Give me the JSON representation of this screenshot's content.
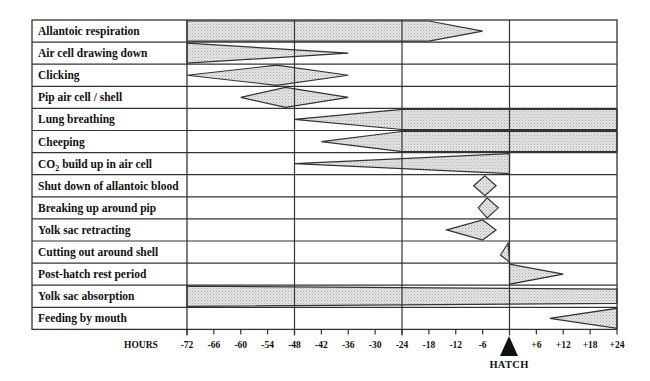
{
  "axis": {
    "label": "HOURS",
    "ticks": [
      "-72",
      "-66",
      "-60",
      "-54",
      "-48",
      "-42",
      "-36",
      "-30",
      "-24",
      "-18",
      "-12",
      "-6",
      "+6",
      "+12",
      "+18",
      "+24"
    ],
    "tick_values": [
      -72,
      -66,
      -60,
      -54,
      -48,
      -42,
      -36,
      -30,
      -24,
      -18,
      -12,
      -6,
      6,
      12,
      18,
      24
    ],
    "range": [
      -72,
      24
    ],
    "major_gridlines": [
      -48,
      -24,
      0
    ],
    "hatch_label": "HATCH",
    "hatch_marker": "filled-triangle",
    "hatch_value": 0
  },
  "rows": [
    {
      "label": "Allantoic respiration",
      "shape": "band-taper",
      "start": -72,
      "full_until": -18,
      "end": -6
    },
    {
      "label": "Air cell drawing down",
      "shape": "taper-right",
      "start": -72,
      "end": -36
    },
    {
      "label": "Clicking",
      "shape": "diamond",
      "start": -72,
      "peak": -52,
      "end": -36
    },
    {
      "label": "Pip air cell / shell",
      "shape": "diamond",
      "start": -60,
      "peak": -50,
      "end": -36
    },
    {
      "label": "Lung breathing",
      "shape": "taper-left-to-band",
      "start": -48,
      "full_from": -24,
      "end": 24
    },
    {
      "label": "Cheeping",
      "shape": "taper-left-to-band",
      "start": -42,
      "full_from": -24,
      "end": 24
    },
    {
      "label": "CO2 build up in air cell",
      "label_main": "CO",
      "label_sub": "2",
      "label_rest": " build up in air cell",
      "shape": "taper-left",
      "start": -48,
      "end": 0
    },
    {
      "label": "Shut down of allantoic blood",
      "shape": "diamond",
      "start": -8,
      "peak": -5.5,
      "end": -3
    },
    {
      "label": "Breaking up around pip",
      "shape": "diamond",
      "start": -7,
      "peak": -5,
      "end": -2.5
    },
    {
      "label": "Yolk sac retracting",
      "shape": "diamond",
      "start": -14,
      "peak": -6,
      "end": -3
    },
    {
      "label": "Cutting out around shell",
      "shape": "diamond",
      "start": -2,
      "peak": 0,
      "end": 0
    },
    {
      "label": "Post-hatch rest period",
      "shape": "taper-right",
      "start": 0,
      "end": 12
    },
    {
      "label": "Yolk sac absorption",
      "shape": "band-to-taper",
      "start": -72,
      "full_until": 0,
      "end": 24
    },
    {
      "label": "Feeding by mouth",
      "shape": "taper-left",
      "start": 9,
      "end": 24
    }
  ],
  "colors": {
    "line": "#333333",
    "fill": "#d9d9d9",
    "background": "#ffffff",
    "text": "#111111"
  }
}
